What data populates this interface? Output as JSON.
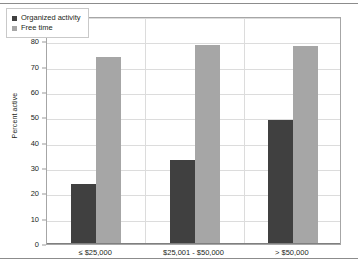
{
  "chart_data": {
    "type": "bar",
    "title": "",
    "subtitle": "",
    "xlabel": "",
    "ylabel": "Percent active",
    "ylim": [
      0,
      90
    ],
    "ytick_step": 10,
    "yticks": [
      0,
      10,
      20,
      30,
      40,
      50,
      60,
      70,
      80,
      90
    ],
    "categories": [
      "≤ $25,000",
      "$25,001 - $50,000",
      "> $50,000"
    ],
    "grid": true,
    "legend_position": "top-left",
    "series": [
      {
        "name": "Organized activity",
        "color": "#404040",
        "values": [
          23.5,
          33,
          49
        ]
      },
      {
        "name": "Free time",
        "color": "#a6a6a6",
        "values": [
          74,
          78.5,
          78
        ]
      }
    ],
    "annotations": []
  },
  "figure": {
    "plot_border_color": "#a6a6a6",
    "gridline_color": "#dcdcdc",
    "background_color": "#ffffff",
    "rule_color": "#8c8c8c"
  }
}
